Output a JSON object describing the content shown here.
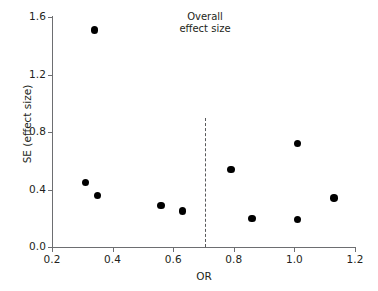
{
  "chart_data": {
    "type": "scatter",
    "title": "",
    "xlabel": "OR",
    "ylabel": "SE (effect size)",
    "xlim": [
      0.2,
      1.2
    ],
    "ylim": [
      0.0,
      1.6
    ],
    "xticks": [
      "0.2",
      "0.4",
      "0.6",
      "0.8",
      "1.0",
      "1.2"
    ],
    "xtick_values": [
      0.2,
      0.4,
      0.6,
      0.8,
      1.0,
      1.2
    ],
    "yticks": [
      "0.0",
      "0.4",
      "0.8",
      "1.2",
      "1.6"
    ],
    "ytick_values": [
      0.0,
      0.4,
      0.8,
      1.2,
      1.6
    ],
    "grid": false,
    "legend": null,
    "marker_color": "#000000",
    "points": [
      {
        "x": 0.34,
        "y": 1.51
      },
      {
        "x": 0.31,
        "y": 0.45
      },
      {
        "x": 0.35,
        "y": 0.36
      },
      {
        "x": 0.56,
        "y": 0.29
      },
      {
        "x": 0.63,
        "y": 0.25
      },
      {
        "x": 0.79,
        "y": 0.54
      },
      {
        "x": 0.86,
        "y": 0.2
      },
      {
        "x": 1.01,
        "y": 0.72
      },
      {
        "x": 1.01,
        "y": 0.19
      },
      {
        "x": 1.13,
        "y": 0.34
      }
    ],
    "annotations": [
      {
        "name": "overall-effect-size",
        "line1": "Overall",
        "line2": "effect size",
        "x": 0.705,
        "line_style": "dashed",
        "line_color": "#58595b",
        "line_top": 0.895,
        "line_bottom": 0.0
      }
    ],
    "axis_color": "#6d6e71",
    "text_color": "#231f20"
  }
}
